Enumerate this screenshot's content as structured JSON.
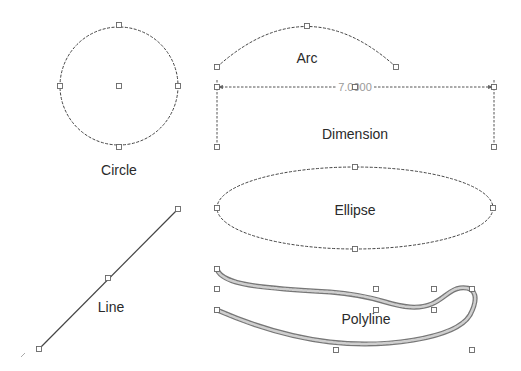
{
  "canvas": {
    "width": 521,
    "height": 371,
    "background": "#ffffff",
    "stroke_color": "#444444",
    "label_color": "#2a2a2a",
    "dimension_text_color": "#9a9a9a"
  },
  "entities": {
    "circle": {
      "label": "Circle",
      "center": [
        119,
        86
      ],
      "radius": 59,
      "grips": [
        [
          119,
          25
        ],
        [
          119,
          147
        ],
        [
          60,
          86
        ],
        [
          178,
          86
        ],
        [
          119,
          86
        ]
      ]
    },
    "arc": {
      "label": "Arc",
      "start": [
        217,
        67
      ],
      "mid": [
        307,
        26
      ],
      "end": [
        396,
        67
      ],
      "grips": [
        [
          217,
          67
        ],
        [
          307,
          26
        ],
        [
          396,
          67
        ]
      ]
    },
    "dimension": {
      "label": "Dimension",
      "value_text": "7.0000",
      "left_x": 217,
      "right_x": 494,
      "dim_y": 87,
      "ext_bottom_y": 147,
      "grips": [
        [
          217,
          87
        ],
        [
          494,
          87
        ],
        [
          217,
          147
        ],
        [
          494,
          147
        ],
        [
          355,
          87
        ]
      ]
    },
    "ellipse": {
      "label": "Ellipse",
      "center": [
        355,
        208
      ],
      "rx": 138,
      "ry": 41,
      "grips": [
        [
          355,
          167
        ],
        [
          355,
          249
        ],
        [
          217,
          208
        ],
        [
          493,
          208
        ]
      ]
    },
    "line": {
      "label": "Line",
      "start": [
        178,
        209
      ],
      "end": [
        39,
        349
      ],
      "grips": [
        [
          178,
          209
        ],
        [
          108,
          278
        ],
        [
          39,
          349
        ]
      ]
    },
    "polyline": {
      "label": "Polyline",
      "grips": [
        [
          217,
          269
        ],
        [
          217,
          289
        ],
        [
          376,
          289
        ],
        [
          434,
          289
        ],
        [
          472,
          289
        ],
        [
          217,
          310
        ],
        [
          376,
          310
        ],
        [
          434,
          310
        ],
        [
          336,
          350
        ],
        [
          472,
          350
        ]
      ]
    }
  }
}
